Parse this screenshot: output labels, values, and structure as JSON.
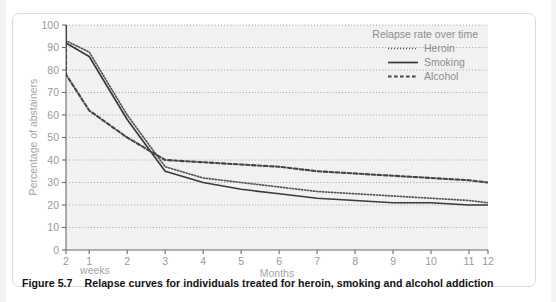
{
  "figure": {
    "caption_label": "Figure 5.7",
    "caption_text": "Relapse curves for individuals treated for heroin, smoking and alcohol addiction"
  },
  "chart_data": {
    "type": "line",
    "title": "",
    "legend_title": "Relapse rate over time",
    "legend_position": "top-right",
    "grid": true,
    "xlabel": "Months",
    "xlabel_secondary": "weeks",
    "ylabel": "Percentage of abstainers",
    "ylim": [
      0,
      100
    ],
    "yticks": [
      0,
      10,
      20,
      30,
      40,
      50,
      60,
      70,
      80,
      90,
      100
    ],
    "ytick_labels": [
      "0",
      "10",
      "20",
      "30",
      "40",
      "50",
      "60",
      "70",
      "80",
      "90",
      "100"
    ],
    "xtick_labels": [
      "2",
      "1",
      "2",
      "3",
      "4",
      "5",
      "6",
      "7",
      "8",
      "9",
      "10",
      "11",
      "12"
    ],
    "xtick_units": [
      "weeks",
      "weeks",
      "months",
      "months",
      "months",
      "months",
      "months",
      "months",
      "months",
      "months",
      "months",
      "months",
      "months"
    ],
    "x_positions": [
      0.0,
      0.055,
      0.145,
      0.235,
      0.325,
      0.415,
      0.505,
      0.595,
      0.685,
      0.775,
      0.865,
      0.955,
      1.0
    ],
    "series": [
      {
        "name": "Heroin",
        "style": "fine-dotted",
        "color": "#555555",
        "x": [
          "0w",
          "2w",
          "1w",
          "2m",
          "3m",
          "4m",
          "5m",
          "6m",
          "7m",
          "8m",
          "9m",
          "10m",
          "11m",
          "12m"
        ],
        "values": [
          100,
          93,
          88,
          60,
          37,
          32,
          30,
          28,
          26,
          25,
          24,
          23,
          22,
          21
        ]
      },
      {
        "name": "Smoking",
        "style": "solid",
        "color": "#3a3a3a",
        "x": [
          "0w",
          "2w",
          "1w",
          "2m",
          "3m",
          "4m",
          "5m",
          "6m",
          "7m",
          "8m",
          "9m",
          "10m",
          "11m",
          "12m"
        ],
        "values": [
          100,
          92,
          86,
          58,
          35,
          30,
          27,
          25,
          23,
          22,
          21,
          21,
          20,
          20
        ]
      },
      {
        "name": "Alcohol",
        "style": "dashed",
        "color": "#444444",
        "x": [
          "0w",
          "2w",
          "1w",
          "2m",
          "3m",
          "4m",
          "5m",
          "6m",
          "7m",
          "8m",
          "9m",
          "10m",
          "11m",
          "12m"
        ],
        "values": [
          100,
          78,
          62,
          50,
          40,
          39,
          38,
          37,
          35,
          34,
          33,
          32,
          31,
          30
        ]
      }
    ]
  },
  "colors": {
    "plot_background": "#f1f1f1",
    "gridline": "#8a8a8a",
    "axis": "#6b6b6b",
    "tick_label": "#9a9a9a",
    "axis_label": "#a0a0a0",
    "legend_text": "#8d8d8d",
    "caption_text": "#121212"
  }
}
